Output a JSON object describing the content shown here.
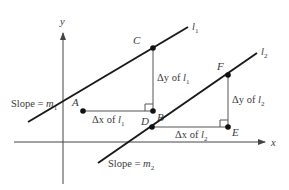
{
  "diagram": {
    "type": "coordinate-geometry-parallel-lines-slope",
    "axes": {
      "x_label": "x",
      "y_label": "y"
    },
    "lines": [
      {
        "id": "l1",
        "label_base": "l",
        "label_sub": "1",
        "slope_label": "Slope = ",
        "slope_var": "m",
        "slope_sub": "1",
        "points": {
          "A": "A",
          "B": "B",
          "C": "C"
        },
        "dx_label": "Δx of ",
        "dy_label": "Δy of ",
        "var": "l",
        "var_sub": "1"
      },
      {
        "id": "l2",
        "label_base": "l",
        "label_sub": "2",
        "slope_label": "Slope = ",
        "slope_var": "m",
        "slope_sub": "2",
        "points": {
          "D": "D",
          "E": "E",
          "F": "F"
        },
        "dx_label": "Δx of ",
        "dy_label": "Δy of ",
        "var": "l",
        "var_sub": "2"
      }
    ],
    "colors": {
      "line": "#1a1a1a",
      "axis": "#444444",
      "text": "#3a3a3a",
      "background": "#ffffff"
    }
  }
}
